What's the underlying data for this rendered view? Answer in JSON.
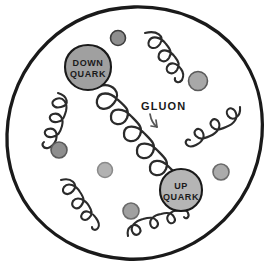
{
  "diagram": {
    "background_color": "#ffffff",
    "boundary": {
      "name": "proton-boundary",
      "shape": "hand-drawn circle",
      "stroke_color": "#1a1a1a",
      "stroke_width": 3.2,
      "fill_color": "#ffffff",
      "cx": 134,
      "cy": 133,
      "rx": 128,
      "ry": 126
    },
    "labels": {
      "down_quark": {
        "line1": "DOWN",
        "line2": "QUARK",
        "font_size": 9,
        "color": "#1a1a1a"
      },
      "up_quark": {
        "line1": "UP",
        "line2": "QUARK",
        "font_size": 9,
        "color": "#1a1a1a"
      },
      "gluon": {
        "text": "GLUON",
        "font_size": 11,
        "color": "#1a1a1a",
        "x": 141,
        "y": 108
      }
    },
    "quarks": [
      {
        "id": "down-quark",
        "label": "DOWN QUARK",
        "cx": 88,
        "cy": 68,
        "r": 23,
        "fill": "#a0a0a0",
        "stroke": "#1a1a1a",
        "stroke_width": 2.0
      },
      {
        "id": "up-quark",
        "label": "UP QUARK",
        "cx": 181,
        "cy": 190,
        "r": 21,
        "fill": "#b5b5b5",
        "stroke": "#1a1a1a",
        "stroke_width": 2.0
      }
    ],
    "sea_particles": [
      {
        "id": "sea-1",
        "cx": 118,
        "cy": 38,
        "r": 7.5,
        "fill": "#8e8e8e",
        "stroke": "#4a4a4a"
      },
      {
        "id": "sea-2",
        "cx": 198,
        "cy": 81,
        "r": 9.5,
        "fill": "#a8a8a8",
        "stroke": "#5a5a5a"
      },
      {
        "id": "sea-3",
        "cx": 59,
        "cy": 150,
        "r": 8.0,
        "fill": "#8e8e8e",
        "stroke": "#5a5a5a"
      },
      {
        "id": "sea-4",
        "cx": 105,
        "cy": 170,
        "r": 7.5,
        "fill": "#b0b0b0",
        "stroke": "#7a7a7a"
      },
      {
        "id": "sea-5",
        "cx": 131,
        "cy": 211,
        "r": 8.0,
        "fill": "#a0a0a0",
        "stroke": "#6a6a6a"
      },
      {
        "id": "sea-6",
        "cx": 221,
        "cy": 172,
        "r": 8.0,
        "fill": "#ababab",
        "stroke": "#6a6a6a"
      }
    ],
    "gluons": [
      {
        "id": "gluon-main-central",
        "description": "large coil connecting down quark to up quark",
        "x1": 98,
        "y1": 88,
        "x2": 170,
        "y2": 172,
        "coils": 8,
        "amplitude": 19,
        "stroke_width": 2.3
      },
      {
        "id": "gluon-top-right",
        "description": "coil upper right area",
        "x1": 146,
        "y1": 32,
        "x2": 176,
        "y2": 76,
        "coils": 6,
        "amplitude": 11,
        "stroke_width": 2.1
      },
      {
        "id": "gluon-left",
        "description": "coil on left edge",
        "x1": 57,
        "y1": 93,
        "x2": 29,
        "y2": 138,
        "coils": 6,
        "amplitude": 10,
        "stroke_width": 2.1
      },
      {
        "id": "gluon-right",
        "description": "coil on right side",
        "x1": 238,
        "y1": 108,
        "x2": 192,
        "y2": 139,
        "coils": 6,
        "amplitude": 10,
        "stroke_width": 2.1
      },
      {
        "id": "gluon-bottom-left",
        "description": "coil lower left",
        "x1": 60,
        "y1": 180,
        "x2": 101,
        "y2": 224,
        "coils": 6,
        "amplitude": 11,
        "stroke_width": 2.1
      },
      {
        "id": "gluon-bottom",
        "description": "coil along bottom",
        "x1": 129,
        "y1": 234,
        "x2": 190,
        "y2": 228,
        "coils": 6,
        "amplitude": 11,
        "stroke_width": 2.1
      }
    ],
    "pointer": {
      "id": "gluon-pointer-arrow",
      "description": "curved arrow from GLUON label to central coil",
      "color": "#555555"
    },
    "colors": {
      "ink": "#1a1a1a",
      "down_quark_fill": "#a0a0a0",
      "up_quark_fill": "#b5b5b5",
      "sea_fill": "#a0a0a0",
      "paper": "#ffffff"
    }
  }
}
